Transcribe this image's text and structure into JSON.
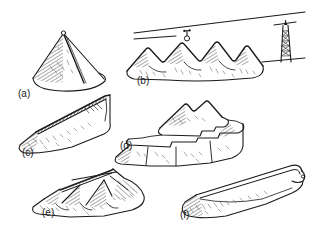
{
  "figure": {
    "kind": "line-drawing",
    "background_color": "#ffffff",
    "ink_color": "#1a1a1a",
    "shade_color": "#5a5a5a",
    "width": 320,
    "height": 238,
    "panels": [
      {
        "key": "a",
        "label": "(a)",
        "name": "conical-stockpile",
        "description": "single conical pile with apex stacking point and hatched flank"
      },
      {
        "key": "b",
        "label": "(b)",
        "name": "row-of-cones-under-ropeway",
        "description": "row of four coalescing conical heaps beneath an aerial ropeway cable with a hanging carriage and a lattice tower"
      },
      {
        "key": "c",
        "label": "(c)",
        "name": "elongated-wedge-pile",
        "description": "long ridge shaped wedge pile with sharp straight crest"
      },
      {
        "key": "d",
        "label": "(d)",
        "name": "terraced-layered-pile",
        "description": "benched stockpile with a flat lower terrace and a cone built on top"
      },
      {
        "key": "e",
        "label": "(e)",
        "name": "merged-wedge-piles",
        "description": "several overlapping wedge piles merged side by side"
      },
      {
        "key": "f",
        "label": "(f)",
        "name": "long-windrow-prism",
        "description": "long smooth prismatic windrow pile with rounded ends"
      }
    ]
  }
}
